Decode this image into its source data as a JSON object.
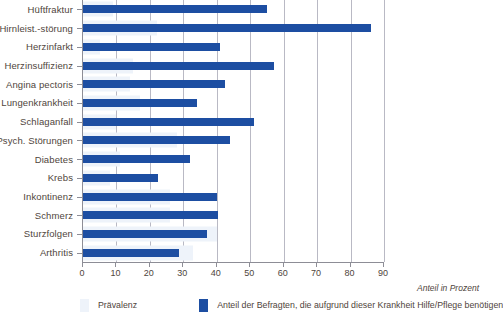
{
  "chart_data": {
    "type": "bar",
    "orientation": "horizontal",
    "title": "",
    "xlabel": "Anteil in Prozent",
    "ylabel": "",
    "xlim": [
      0,
      90
    ],
    "xticks": [
      0,
      10,
      20,
      30,
      40,
      50,
      60,
      70,
      80,
      90
    ],
    "grid": true,
    "legend_position": "bottom",
    "categories": [
      "Hüftfraktur",
      "Hirnleist.-störung",
      "Herzinfarkt",
      "Herzinsuffizienz",
      "Angina pectoris",
      "Lungenkrankheit",
      "Schlaganfall",
      "Psych. Störungen",
      "Diabetes",
      "Krebs",
      "Inkontinenz",
      "Schmerz",
      "Sturzfolgen",
      "Arthritis"
    ],
    "series": [
      {
        "name": "Prävalenz",
        "color": "#eef3fa",
        "values": [
          9,
          22,
          5,
          15,
          14,
          17,
          10,
          28,
          11,
          8,
          26,
          26,
          40,
          33
        ]
      },
      {
        "name": "Anteil der Befragten, die aufgrund dieser Krankheit Hilfe/Pflege benötigen",
        "color": "#1d4ea2",
        "values": [
          55,
          86,
          41,
          57,
          42.5,
          34,
          51,
          44,
          32,
          22.5,
          40,
          40.5,
          37,
          28.7
        ]
      }
    ]
  },
  "axis": {
    "x_title": "Anteil in Prozent",
    "tick_labels": [
      "0",
      "10",
      "20",
      "30",
      "40",
      "50",
      "60",
      "70",
      "80",
      "90"
    ]
  },
  "legend": {
    "items": [
      {
        "label": "Prävalenz",
        "color": "#eef3fa"
      },
      {
        "label": "Anteil der Befragten, die aufgrund dieser Krankheit Hilfe/Pflege benötigen",
        "color": "#1d4ea2"
      }
    ]
  },
  "colors": {
    "bar_main": "#1d4ea2",
    "bar_prevalence": "#eef3fa",
    "axis": "#8d8d96",
    "gridline": "#b9b9c4",
    "text": "#4f453c",
    "background": "#ffffff"
  }
}
